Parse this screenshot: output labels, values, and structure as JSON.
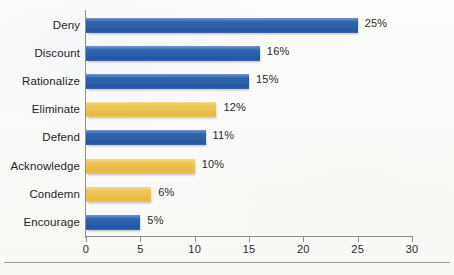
{
  "chart_data": {
    "type": "bar",
    "orientation": "horizontal",
    "title": "",
    "subtitle": "",
    "xlabel": "",
    "ylabel": "",
    "categories": [
      "Deny",
      "Discount",
      "Rationalize",
      "Eliminate",
      "Defend",
      "Acknowledge",
      "Condemn",
      "Encourage"
    ],
    "values": [
      25,
      16,
      15,
      12,
      11,
      10,
      6,
      5
    ],
    "value_labels": [
      "25%",
      "16%",
      "15%",
      "12%",
      "11%",
      "10%",
      "6%",
      "5%"
    ],
    "series_colors": [
      "blue",
      "blue",
      "blue",
      "gold",
      "blue",
      "gold",
      "gold",
      "blue"
    ],
    "xlim": [
      0,
      30
    ],
    "xticks": [
      0,
      5,
      10,
      15,
      20,
      25,
      30
    ],
    "xtick_labels": [
      "0",
      "5",
      "10",
      "15",
      "20",
      "25",
      "30"
    ],
    "grid": false,
    "legend": "none",
    "colors": {
      "blue": "#2a5da8",
      "gold": "#eabf4b",
      "axis": "#8a8f99",
      "text": "#2b2b2b",
      "background": "#fbfbf9",
      "rule": "#9a9a98"
    }
  }
}
